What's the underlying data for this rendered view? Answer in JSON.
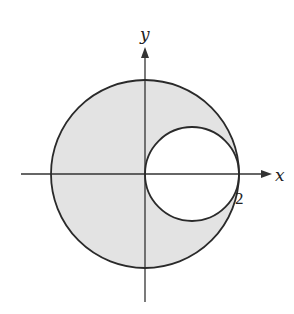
{
  "figure": {
    "type": "polar-region-diagram",
    "axes": {
      "x_label": "x",
      "y_label": "y"
    },
    "tick_labels": {
      "x_right": "2"
    },
    "regions": {
      "outer_circle": {
        "center": [
          0,
          0
        ],
        "radius": 2
      },
      "inner_circle": {
        "center": [
          1,
          0
        ],
        "radius": 1
      },
      "shaded": "inside outer circle, outside inner circle"
    },
    "colors": {
      "fill": "#e3e3e3",
      "stroke": "#2a2a2a",
      "axis": "#333333",
      "background": "#ffffff"
    }
  }
}
